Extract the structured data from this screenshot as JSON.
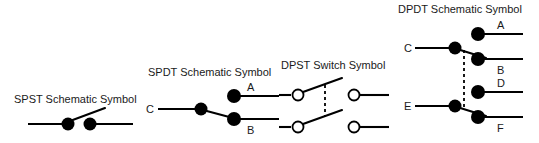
{
  "page": {
    "background_color": "#ffffff",
    "ink_color": "#000000",
    "width": 539,
    "height": 143
  },
  "symbols": [
    {
      "id": "spst",
      "title": "SPST Schematic Symbol",
      "contact_style": "filled",
      "terminal_labels": [],
      "ganged": false,
      "poles": 1,
      "throws": 1
    },
    {
      "id": "spdt",
      "title": "SPDT Schematic Symbol",
      "contact_style": "filled",
      "terminal_labels": [
        "A",
        "B",
        "C"
      ],
      "ganged": false,
      "poles": 1,
      "throws": 2
    },
    {
      "id": "dpst",
      "title": "DPST Switch Symbol",
      "contact_style": "open",
      "terminal_labels": [],
      "ganged": true,
      "poles": 2,
      "throws": 1
    },
    {
      "id": "dpdt",
      "title": "DPDT Schematic Symbol",
      "contact_style": "filled",
      "terminal_labels": [
        "A",
        "B",
        "C",
        "D",
        "E",
        "F"
      ],
      "ganged": true,
      "poles": 2,
      "throws": 2
    }
  ],
  "labels": {
    "spst_title": "SPST Schematic Symbol",
    "spdt_title": "SPDT Schematic Symbol",
    "dpst_title": "DPST Switch Symbol",
    "dpdt_title": "DPDT Schematic Symbol",
    "spdt_a": "A",
    "spdt_b": "B",
    "spdt_c": "C",
    "dpdt_a": "A",
    "dpdt_b": "B",
    "dpdt_c": "C",
    "dpdt_d": "D",
    "dpdt_e": "E",
    "dpdt_f": "F"
  }
}
